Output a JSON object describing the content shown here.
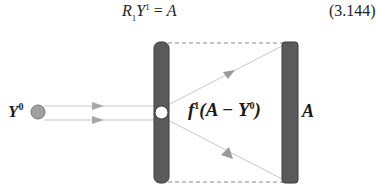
{
  "equation": {
    "lhs_R": "R",
    "lhs_R_sub": "1",
    "lhs_Y": "Y",
    "lhs_Y_sup": "1",
    "eq_sign": " = ",
    "rhs": "A",
    "number": "(3.144)"
  },
  "diagram": {
    "source_label": "Y",
    "source_label_sup": "0",
    "function_label_f": "f",
    "function_label_sup": "1",
    "function_label_open": "(A − Y",
    "function_label_sup2": "0",
    "function_label_close": ")",
    "target_label": "A",
    "colors": {
      "bar_fill": "#5a5a5a",
      "bar_stroke": "#3a3a3a",
      "source_dot": "#a0a0a0",
      "lines": "#c8c8c8",
      "arrows": "#9a9a9a",
      "dashed_border": "#888888"
    }
  }
}
